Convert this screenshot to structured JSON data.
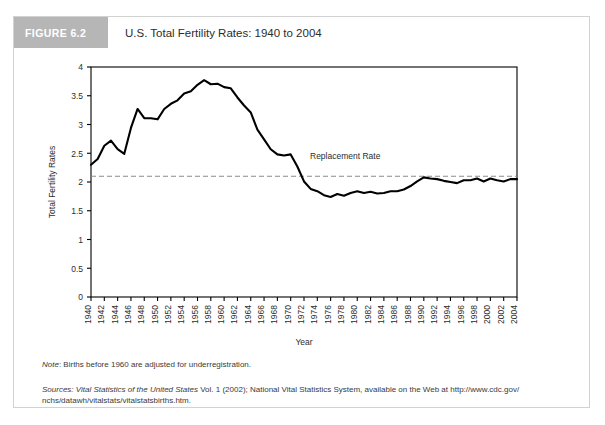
{
  "figure": {
    "badge": "FIGURE 6.2",
    "title": "U.S. Total Fertility Rates: 1940 to 2004"
  },
  "notes": {
    "note_label": "Note",
    "note_text": ": Births before 1960 are adjusted for underregistration.",
    "sources_label": "Sources",
    "sources_italic_1": ": Vital Statistics of the United States",
    "sources_roman_1": " Vol. 1 (2002); National Vital Statistics System, available on the Web at http://www.cdc.gov/",
    "sources_roman_2": "nchs/datawh/vitalstats/vitalstatsbirths.htm."
  },
  "colors": {
    "line": "#000000",
    "replacement_line": "#8c8c8c",
    "badge_bg": "#b6b6b6",
    "frame": "#d2d2d2",
    "axis": "#000000",
    "text": "#2c2c2c"
  },
  "chart_data": {
    "type": "line",
    "title": "U.S. Total Fertility Rates: 1940 to 2004",
    "xlabel": "Year",
    "ylabel": "Total Fertility Rates",
    "xlim": [
      1940,
      2004
    ],
    "ylim": [
      0,
      4
    ],
    "yticks": [
      0,
      0.5,
      1,
      1.5,
      2,
      2.5,
      3,
      3.5,
      4
    ],
    "ytick_labels": [
      "0",
      "0.5",
      "1",
      "1.5",
      "2",
      "2.5",
      "3",
      "3.5",
      "4"
    ],
    "xticks": [
      1940,
      1942,
      1944,
      1946,
      1948,
      1950,
      1952,
      1954,
      1956,
      1958,
      1960,
      1962,
      1964,
      1966,
      1968,
      1970,
      1972,
      1974,
      1976,
      1978,
      1980,
      1982,
      1984,
      1986,
      1988,
      1990,
      1992,
      1994,
      1996,
      1998,
      2000,
      2002,
      2004
    ],
    "xtick_labels": [
      "1940",
      "1942",
      "1944",
      "1946",
      "1948",
      "1950",
      "1952",
      "1954",
      "1956",
      "1958",
      "1960",
      "1962",
      "1964",
      "1966",
      "1968",
      "1970",
      "1972",
      "1974",
      "1976",
      "1978",
      "1980",
      "1982",
      "1984",
      "1986",
      "1988",
      "1990",
      "1992",
      "1994",
      "1996",
      "1998",
      "2000",
      "2002",
      "2004"
    ],
    "grid": false,
    "legend": "none",
    "annotations": [
      {
        "label": "Replacement Rate",
        "value": 2.1,
        "style": "dashed-horizontal-line"
      }
    ],
    "series": [
      {
        "name": "Total Fertility Rate",
        "x": [
          1940,
          1941,
          1942,
          1943,
          1944,
          1945,
          1946,
          1947,
          1948,
          1949,
          1950,
          1951,
          1952,
          1953,
          1954,
          1955,
          1956,
          1957,
          1958,
          1959,
          1960,
          1961,
          1962,
          1963,
          1964,
          1965,
          1966,
          1967,
          1968,
          1969,
          1970,
          1971,
          1972,
          1973,
          1974,
          1975,
          1976,
          1977,
          1978,
          1979,
          1980,
          1981,
          1982,
          1983,
          1984,
          1985,
          1986,
          1987,
          1988,
          1989,
          1990,
          1991,
          1992,
          1993,
          1994,
          1995,
          1996,
          1997,
          1998,
          1999,
          2000,
          2001,
          2002,
          2003,
          2004
        ],
        "values": [
          2.3,
          2.4,
          2.63,
          2.72,
          2.57,
          2.49,
          2.94,
          3.27,
          3.11,
          3.11,
          3.09,
          3.27,
          3.36,
          3.42,
          3.54,
          3.58,
          3.69,
          3.77,
          3.7,
          3.71,
          3.65,
          3.63,
          3.47,
          3.33,
          3.21,
          2.91,
          2.74,
          2.57,
          2.48,
          2.46,
          2.48,
          2.27,
          2.01,
          1.88,
          1.84,
          1.77,
          1.74,
          1.79,
          1.76,
          1.81,
          1.84,
          1.81,
          1.83,
          1.8,
          1.81,
          1.84,
          1.84,
          1.87,
          1.93,
          2.01,
          2.08,
          2.06,
          2.05,
          2.02,
          2.0,
          1.98,
          2.03,
          2.03,
          2.06,
          2.01,
          2.06,
          2.03,
          2.01,
          2.05,
          2.05
        ]
      }
    ]
  }
}
